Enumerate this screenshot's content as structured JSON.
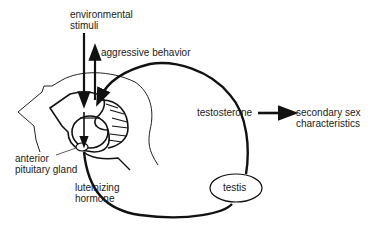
{
  "diagram": {
    "labels": {
      "environmental_stimuli": [
        "environmental",
        "stimuli"
      ],
      "aggressive_behavior": "aggressive behavior",
      "testosterone": "testosterone",
      "secondary_sex": [
        "secondary sex",
        "characteristics"
      ],
      "anterior_pituitary": [
        "anterior",
        "pituitary gland"
      ],
      "luteinizing_hormone": [
        "luteinizing",
        "hormone"
      ],
      "testis": "testis"
    },
    "colors": {
      "line": "#111111",
      "background": "#ffffff"
    }
  }
}
